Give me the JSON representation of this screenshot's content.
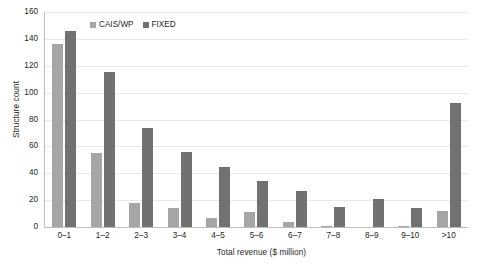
{
  "chart_data": {
    "type": "bar",
    "title": "",
    "xlabel": "Total revenue ($ million)",
    "ylabel": "Structure count",
    "categories": [
      "0–1",
      "1–2",
      "2–3",
      "3–4",
      "4–5",
      "5–6",
      "6–7",
      "7–8",
      "8–9",
      "9–10",
      ">10"
    ],
    "series": [
      {
        "name": "CAIS/WP",
        "color": "#a6a6a6",
        "values": [
          136,
          55,
          18,
          14,
          7,
          11,
          4,
          1,
          0,
          1,
          12
        ]
      },
      {
        "name": "FIXED",
        "color": "#717171",
        "values": [
          146,
          115,
          74,
          56,
          45,
          34,
          27,
          15,
          21,
          14,
          92
        ]
      }
    ],
    "ylim": [
      0,
      160
    ],
    "ytick_values": [
      0,
      20,
      40,
      60,
      80,
      100,
      120,
      140,
      160
    ],
    "ytick_labels": [
      "0",
      "20",
      "40",
      "60",
      "80",
      "100",
      "120",
      "140",
      "160"
    ],
    "grid": "horizontal",
    "legend_position": "top-left-inside"
  }
}
